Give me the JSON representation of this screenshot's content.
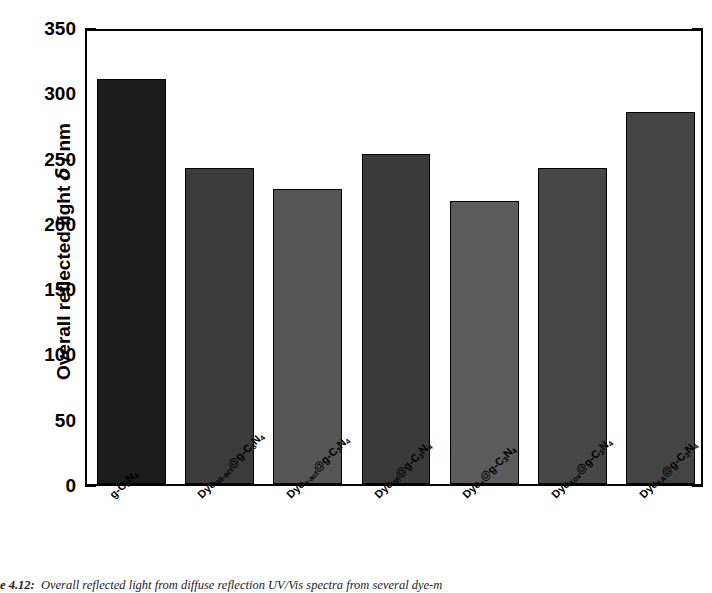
{
  "chart_data": {
    "type": "bar",
    "title": "",
    "xlabel": "",
    "ylabel": "Overall reflected light δ / nm",
    "ylabel_prefix": "Overall reflected light ",
    "ylabel_symbol": "δ",
    "ylabel_suffix": " / nm",
    "ylim": [
      0,
      350
    ],
    "ytick_values": [
      0,
      50,
      100,
      150,
      200,
      250,
      300,
      350
    ],
    "ytick_labels": [
      "0",
      "50",
      "100",
      "150",
      "200",
      "250",
      "300",
      "350"
    ],
    "yminor_step": 25,
    "grid": false,
    "legend": "none",
    "categories": [
      "g-C3N4",
      "DyeWl-act@g-C3N4",
      "Dyee-act@g-C3N4",
      "DyeWl@g-C3N4",
      "Dyee@g-C3N4",
      "DyeKov@g-C3N4",
      "DyeEA@g-C3N4"
    ],
    "values": [
      310,
      242,
      226,
      253,
      217,
      242,
      285
    ],
    "bar_colors": [
      "#1c1c1c",
      "#3b3b3b",
      "#565656",
      "#3a3a3a",
      "#5c5c5c",
      "#474747",
      "#444444"
    ],
    "bars": [
      {
        "label_main": "g-C",
        "label_sub1": "3",
        "label_mid": "N",
        "label_sub2": "4",
        "value": 310,
        "color": "#1c1c1c"
      },
      {
        "label_main": "Dye",
        "label_sub1": "Wl-act",
        "label_mid": "@g-C",
        "label_sub2": "3",
        "label_mid2": "N",
        "label_sub3": "4",
        "value": 242,
        "color": "#3b3b3b"
      },
      {
        "label_main": "Dye",
        "label_sub1": "e-act",
        "label_mid": "@g-C",
        "label_sub2": "3",
        "label_mid2": "N",
        "label_sub3": "4",
        "value": 226,
        "color": "#565656"
      },
      {
        "label_main": "Dye",
        "label_sub1": "Wl",
        "label_mid": "@g-C",
        "label_sub2": "3",
        "label_mid2": "N",
        "label_sub3": "4",
        "value": 253,
        "color": "#3a3a3a"
      },
      {
        "label_main": "Dye",
        "label_sub1": "e",
        "label_mid": "@g-C",
        "label_sub2": "3",
        "label_mid2": "N",
        "label_sub3": "4",
        "value": 217,
        "color": "#5c5c5c"
      },
      {
        "label_main": "Dye",
        "label_sub1": "Kov",
        "label_mid": "@g-C",
        "label_sub2": "3",
        "label_mid2": "N",
        "label_sub3": "4",
        "value": 242,
        "color": "#474747"
      },
      {
        "label_main": "Dye",
        "label_sub1": "EA",
        "label_mid": "@g-C",
        "label_sub2": "3",
        "label_mid2": "N",
        "label_sub3": "4",
        "value": 285,
        "color": "#444444"
      }
    ]
  },
  "caption": {
    "number": "e 4.12:",
    "text": "Overall reflected light from diffuse reflection UV/Vis spectra from several dye-m"
  }
}
